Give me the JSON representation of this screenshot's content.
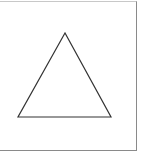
{
  "diagram": {
    "shape": "triangle",
    "stroke_color": "#333333",
    "frame_color": "#8a8a8a",
    "points": "65,33 18,117 111,117"
  }
}
